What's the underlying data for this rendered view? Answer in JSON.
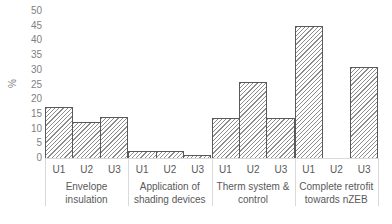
{
  "chart_data": {
    "type": "bar",
    "title": "",
    "xlabel": "",
    "ylabel": "%",
    "ylim": [
      0,
      50
    ],
    "yticks": [
      0,
      5,
      10,
      15,
      20,
      25,
      30,
      35,
      40,
      45,
      50
    ],
    "grid": false,
    "legend": null,
    "groups": [
      {
        "label": "Envelope insulation",
        "categories": [
          "U1",
          "U2",
          "U3"
        ],
        "values": [
          17.3,
          12.2,
          14.0
        ]
      },
      {
        "label": "Application of shading devices",
        "categories": [
          "U1",
          "U2",
          "U3"
        ],
        "values": [
          2.3,
          2.5,
          0.9
        ]
      },
      {
        "label": "Therm system & control",
        "categories": [
          "U1",
          "U2",
          "U3"
        ],
        "values": [
          13.6,
          25.7,
          13.6
        ]
      },
      {
        "label": "Complete retrofit towards nZEB",
        "categories": [
          "U1",
          "U2",
          "U3"
        ],
        "values": [
          45.0,
          0,
          30.8
        ]
      }
    ],
    "pattern": "diagonal-hatch",
    "bar_edge_color": "#595959"
  },
  "axis": {
    "ylabel": "%",
    "yticks": [
      "50",
      "45",
      "40",
      "35",
      "30",
      "25",
      "20",
      "15",
      "10",
      "5",
      "0"
    ]
  },
  "groups": [
    {
      "line1": "Envelope insulation",
      "line2": "",
      "ticks": [
        "U1",
        "U2",
        "U3"
      ]
    },
    {
      "line1": "Application of",
      "line2": "shading devices",
      "ticks": [
        "U1",
        "U2",
        "U3"
      ]
    },
    {
      "line1": "Therm system &",
      "line2": "control",
      "ticks": [
        "U1",
        "U2",
        "U3"
      ]
    },
    {
      "line1": "Complete retrofit",
      "line2": "towards nZEB",
      "ticks": [
        "U1",
        "U2",
        "U3"
      ]
    }
  ],
  "caption": {
    "text": "Fig. 4. EPC improvement ... (truncated)"
  }
}
